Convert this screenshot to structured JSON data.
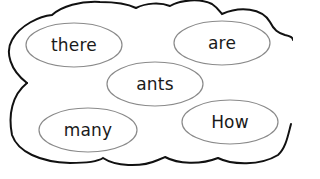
{
  "activity": {
    "type": "word-cloud-sentence-ordering",
    "words": [
      {
        "id": "there",
        "label": "there",
        "cx": 74,
        "cy": 45,
        "rx": 48,
        "ry": 22
      },
      {
        "id": "are",
        "label": "are",
        "cx": 222,
        "cy": 43,
        "rx": 48,
        "ry": 22
      },
      {
        "id": "ants",
        "label": "ants",
        "cx": 155,
        "cy": 84,
        "rx": 48,
        "ry": 22
      },
      {
        "id": "many",
        "label": "many",
        "cx": 88,
        "cy": 130,
        "rx": 49,
        "ry": 22
      },
      {
        "id": "how",
        "label": "How",
        "cx": 230,
        "cy": 122,
        "rx": 48,
        "ry": 22
      }
    ]
  },
  "colors": {
    "cloud_outline": "#111111",
    "bubble_outline": "#8a8a8a",
    "text": "#1a1a1a",
    "background": "#ffffff"
  }
}
